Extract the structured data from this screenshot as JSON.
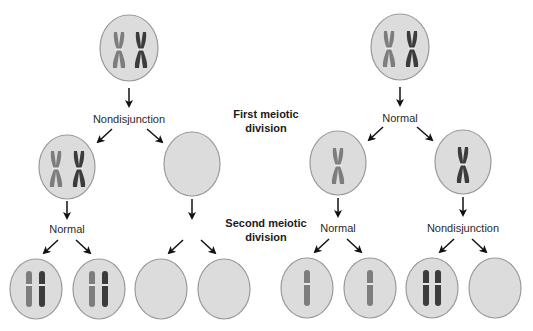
{
  "diagram": {
    "stages": {
      "first": [
        "First meiotic",
        "division"
      ],
      "second": [
        "Second meiotic",
        "division"
      ]
    },
    "left_pathway": {
      "first_division_event": "Nondisjunction",
      "second_division_event": "Normal",
      "gametes": [
        "n+1",
        "n+1",
        "n-1",
        "n-1"
      ]
    },
    "right_pathway": {
      "first_division_event": "Normal",
      "second_division_event_left": "Normal",
      "second_division_event_right": "Nondisjunction",
      "gametes": [
        "n",
        "n",
        "n+1",
        "n-1"
      ]
    },
    "colors": {
      "cell_fill": "#dcdcdc",
      "cell_stroke": "#9a9a9a",
      "chromosome_light": "#7d7d7d",
      "chromosome_dark": "#3c3c3c",
      "arrow": "#111111"
    }
  }
}
